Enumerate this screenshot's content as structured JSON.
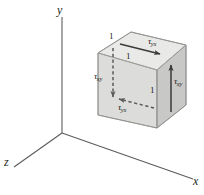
{
  "figure": {
    "background_color": "#ffffff",
    "line_color": "#231f20",
    "axes": {
      "x_label": "x",
      "y_label": "y",
      "z_label": "z",
      "origin": [
        62,
        133
      ]
    },
    "cube": {
      "edge_length_label": "1",
      "dimension_labels": [
        "1",
        "1",
        "1"
      ],
      "top_face_color": "#e8e8e6",
      "left_face_color": "#dededc",
      "front_face_color": "#c9c9c7"
    },
    "stresses": [
      {
        "name": "tau-yx-top",
        "symbol": "τ",
        "subscript": "yx",
        "position": "top-face",
        "arrow": "solid",
        "direction": "right"
      },
      {
        "name": "tau-xy-left",
        "symbol": "τ",
        "subscript": "xy",
        "position": "left-face",
        "arrow": "dashed",
        "direction": "down"
      },
      {
        "name": "tau-xy-right",
        "symbol": "τ",
        "subscript": "xy",
        "position": "right-face",
        "arrow": "solid",
        "direction": "up"
      },
      {
        "name": "tau-yx-bottom",
        "symbol": "τ",
        "subscript": "yx",
        "position": "bottom-face",
        "arrow": "dashed",
        "direction": "left"
      }
    ]
  }
}
